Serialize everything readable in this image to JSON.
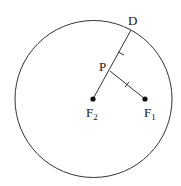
{
  "diagram": {
    "circle": {
      "cx": 93.5,
      "cy": 99,
      "r": 78.5,
      "stroke": "#333333"
    },
    "points": {
      "D": {
        "label": "D",
        "x": 131,
        "y": 30
      },
      "P": {
        "label": "P",
        "x": 110,
        "y": 71
      },
      "F2": {
        "label": "F",
        "sub": "2",
        "x": 93,
        "y": 99
      },
      "F1": {
        "label": "F",
        "sub": "1",
        "x": 145,
        "y": 99
      }
    },
    "segments": [
      {
        "from": "F2",
        "to": "D"
      },
      {
        "from": "P",
        "to": "F1"
      }
    ],
    "tick_marks": [
      "PD",
      "PF1"
    ]
  }
}
